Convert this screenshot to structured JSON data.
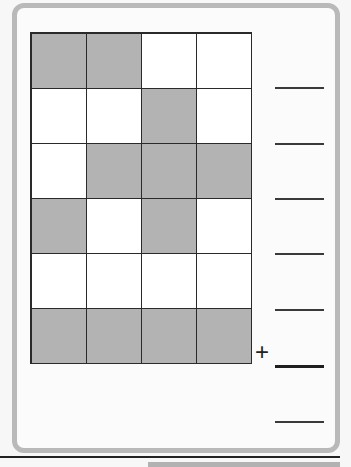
{
  "worksheet": {
    "grid": {
      "rows": 6,
      "cols": 4,
      "cells": [
        [
          true,
          true,
          false,
          false
        ],
        [
          false,
          false,
          true,
          false
        ],
        [
          false,
          true,
          true,
          true
        ],
        [
          true,
          false,
          true,
          false
        ],
        [
          false,
          false,
          false,
          false
        ],
        [
          true,
          true,
          true,
          true
        ]
      ],
      "colors": {
        "shaded": "#b3b3b3",
        "blank": "#ffffff",
        "border": "#2a2a2a"
      }
    },
    "answer_lines": [
      {
        "row": 2,
        "y": 87
      },
      {
        "row": 3,
        "y": 143
      },
      {
        "row": 4,
        "y": 198
      },
      {
        "row": 5,
        "y": 253
      },
      {
        "row": 6,
        "y": 309
      }
    ],
    "sum_operator": "+",
    "sum_line_y": 365,
    "total_line_y": 421
  }
}
